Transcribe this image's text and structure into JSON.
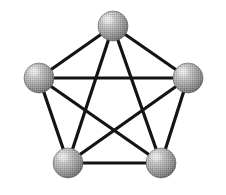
{
  "figure": {
    "background_color": "#ffffff",
    "width": 226,
    "height": 195,
    "caption": ""
  },
  "style": {
    "edge_color": "#141414",
    "edge_width": 3.2,
    "node_fill_light": "#d8d8d8",
    "node_fill_mid": "#9a9a9a",
    "node_fill_dark": "#6b6b6b",
    "node_outline": "#5a5a5a",
    "node_highlight": "#ebebeb",
    "node_shadow": "#5d5d5d"
  },
  "chart_data": {
    "type": "diagram",
    "graph_name": "K5",
    "node_count": 5,
    "edge_count": 10,
    "nodes": [
      {
        "id": "top",
        "label": "",
        "cx": 113,
        "cy": 26,
        "r": 15
      },
      {
        "id": "left",
        "label": "",
        "cx": 39,
        "cy": 78,
        "r": 15
      },
      {
        "id": "right",
        "label": "",
        "cx": 188,
        "cy": 78,
        "r": 15
      },
      {
        "id": "bottom-left",
        "label": "",
        "cx": 68,
        "cy": 163,
        "r": 15
      },
      {
        "id": "bottom-right",
        "label": "",
        "cx": 161,
        "cy": 163,
        "r": 15
      }
    ],
    "edges": [
      {
        "from": "top",
        "to": "left",
        "kind": "pentagon-side"
      },
      {
        "from": "top",
        "to": "right",
        "kind": "pentagon-side"
      },
      {
        "from": "left",
        "to": "bottom-left",
        "kind": "pentagon-side"
      },
      {
        "from": "right",
        "to": "bottom-right",
        "kind": "pentagon-side"
      },
      {
        "from": "bottom-left",
        "to": "bottom-right",
        "kind": "pentagon-side"
      },
      {
        "from": "left",
        "to": "right",
        "kind": "diagonal"
      },
      {
        "from": "top",
        "to": "bottom-left",
        "kind": "diagonal"
      },
      {
        "from": "top",
        "to": "bottom-right",
        "kind": "diagonal"
      },
      {
        "from": "left",
        "to": "bottom-right",
        "kind": "diagonal"
      },
      {
        "from": "right",
        "to": "bottom-left",
        "kind": "diagonal"
      }
    ]
  }
}
